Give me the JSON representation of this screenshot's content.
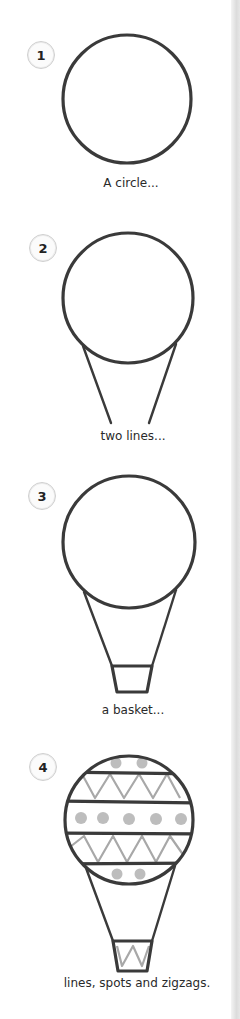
{
  "steps": [
    {
      "number": "1",
      "caption": "A circle...",
      "element": "circle"
    },
    {
      "number": "2",
      "caption": "two lines...",
      "element": "two-lines"
    },
    {
      "number": "3",
      "caption": "a basket...",
      "element": "basket"
    },
    {
      "number": "4",
      "caption": "lines, spots and zigzags.",
      "element": "decorations"
    }
  ],
  "colors": {
    "ink": "#3a3a3a",
    "pattern_gray": "#a8a8a8",
    "spot_gray": "#bdbdbd",
    "badge_border": "#cfcfcf"
  }
}
